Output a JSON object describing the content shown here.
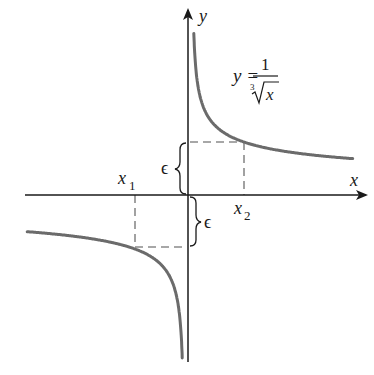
{
  "diagram": {
    "colors": {
      "axis": "#1a1a1a",
      "curve": "#6b6b6b",
      "dashed": "#8a8a8a",
      "text": "#1a1a1a"
    },
    "axes": {
      "x_label": "x",
      "y_label": "y"
    },
    "formula": {
      "lhs": "y =",
      "numerator": "1",
      "root_index": "3",
      "radicand": "x"
    },
    "points": {
      "x1_label": "x",
      "x1_sub": "1",
      "x2_label": "x",
      "x2_sub": "2"
    },
    "epsilon": {
      "upper_label": "ϵ",
      "lower_label": "ϵ"
    }
  }
}
